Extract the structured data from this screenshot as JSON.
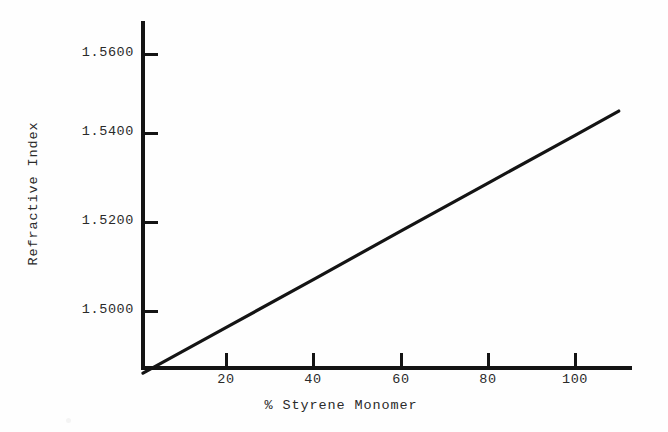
{
  "chart_data": {
    "type": "line",
    "title": "",
    "xlabel": "% Styrene Monomer",
    "ylabel": "Refractive Index",
    "xlim": [
      0,
      113
    ],
    "ylim": [
      1.4856,
      1.5672
    ],
    "xticks": [
      20,
      40,
      60,
      80,
      100
    ],
    "xtick_labels": [
      "20",
      "40",
      "60",
      "80",
      "100"
    ],
    "yticks": [
      1.5,
      1.52,
      1.54,
      1.56
    ],
    "ytick_labels": [
      "1.5000",
      "1.5200",
      "1.5400",
      "1.5600"
    ],
    "grid": false,
    "legend": null,
    "line_color": "#141414",
    "series": [
      {
        "name": "Refractive index vs styrene monomer",
        "x": [
          0,
          20,
          40,
          60,
          80,
          100,
          110
        ],
        "y": [
          1.4856,
          1.4967,
          1.5078,
          1.519,
          1.5301,
          1.5412,
          1.5468
        ]
      }
    ]
  },
  "axes": {
    "y_title": "Refractive Index",
    "x_title": "% Styrene Monomer",
    "y_tick_0": "1.5600",
    "y_tick_1": "1.5400",
    "y_tick_2": "1.5200",
    "y_tick_3": "1.5000",
    "x_tick_0": "20",
    "x_tick_1": "40",
    "x_tick_2": "60",
    "x_tick_3": "80",
    "x_tick_4": "100"
  }
}
